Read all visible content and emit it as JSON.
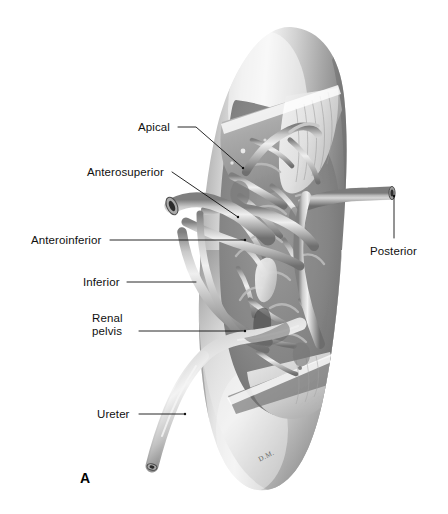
{
  "figure": {
    "panel_letter": "A",
    "artist_signature": "D.M.",
    "background_color": "#ffffff",
    "ink_color": "#101010"
  },
  "labels": [
    {
      "id": "apical",
      "text": "Apical",
      "x": 138,
      "y": 121,
      "align": "left",
      "leader": "M 178 127 L 196 127 L 243 168"
    },
    {
      "id": "anterosuperior",
      "text": "Anterosuperior",
      "x": 87,
      "y": 166,
      "align": "left",
      "leader": "M 172 172 L 238 217"
    },
    {
      "id": "anteroinferior",
      "text": "Anteroinferior",
      "x": 31,
      "y": 234,
      "align": "left",
      "leader": "M 110 240 L 245 240"
    },
    {
      "id": "inferior",
      "text": "Inferior",
      "x": 83,
      "y": 276,
      "align": "left",
      "leader": "M 127 282 L 196 282"
    },
    {
      "id": "renal-pelvis",
      "text": "Renal\npelvis",
      "line1": "Renal",
      "line2": "pelvis",
      "x": 92,
      "y": 312,
      "align": "left",
      "leader": "M 139 331 L 245 331"
    },
    {
      "id": "ureter",
      "text": "Ureter",
      "x": 97,
      "y": 408,
      "align": "left",
      "leader": "M 139 414 L 185 414"
    },
    {
      "id": "posterior",
      "text": "Posterior",
      "x": 370,
      "y": 245,
      "align": "left",
      "leader": "M 394 196 L 394 238"
    }
  ],
  "anatomy_parts": [
    "kidney-cortex",
    "kidney-cut-surface",
    "renal-artery-apical-branch",
    "renal-artery-anterosuperior-branch",
    "renal-artery-anteroinferior-branch",
    "renal-artery-inferior-branch",
    "renal-artery-posterior-branch",
    "renal-pelvis",
    "ureter"
  ]
}
